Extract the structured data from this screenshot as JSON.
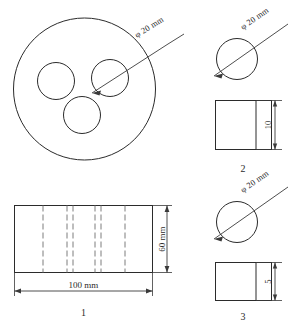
{
  "drawing": {
    "title": "Cylindrical specimen engineering drawing",
    "line_color": "#2b2b2b",
    "hidden_line_color": "#7d7d7d",
    "dimension_color": "#3a3a3a",
    "background": "#ffffff"
  },
  "items": [
    {
      "number": "1",
      "end_view": {
        "kind": "circle-with-three-holes",
        "hole_label": "φ 20 mm"
      },
      "side_view": {
        "kind": "rectangle-with-hidden-lines",
        "width_label": "100 mm",
        "height_label": "60 mm"
      }
    },
    {
      "number": "2",
      "end_view": {
        "kind": "circle-with-diameter-line",
        "hole_label": "φ 20 mm"
      },
      "side_view": {
        "kind": "rectangle-with-partition",
        "thickness_label": "10"
      }
    },
    {
      "number": "3",
      "end_view": {
        "kind": "circle-with-diameter-line",
        "hole_label": "φ 20 mm"
      },
      "side_view": {
        "kind": "rectangle-with-partition",
        "thickness_label": "5"
      }
    }
  ],
  "labels": {
    "dia_1": "φ 20 mm",
    "dia_2": "φ 20 mm",
    "dia_3": "φ 20 mm",
    "width_1": "100 mm",
    "height_1": "60 mm",
    "thickness_2": "10",
    "thickness_3": "5",
    "item_1": "1",
    "item_2": "2",
    "item_3": "3"
  }
}
